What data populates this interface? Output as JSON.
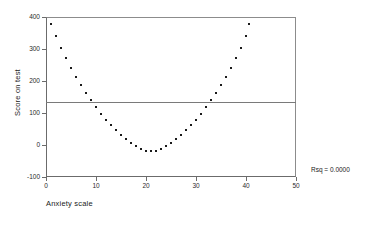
{
  "chart_data": {
    "type": "scatter",
    "title": "",
    "xlabel": "Anxiety scale",
    "ylabel": "Score on test",
    "xlim": [
      0,
      50
    ],
    "ylim": [
      -100,
      400
    ],
    "xticks": [
      0,
      10,
      20,
      30,
      40,
      50
    ],
    "yticks": [
      -100,
      0,
      100,
      200,
      300,
      400
    ],
    "xtick_labels": [
      "0",
      "10",
      "20",
      "30",
      "40",
      "50"
    ],
    "ytick_labels": [
      "-100",
      "0",
      "100",
      "200",
      "300",
      "400"
    ],
    "grid": false,
    "legend": null,
    "annotations": [
      {
        "name": "rsq",
        "text": "Rsq = 0.0000"
      }
    ],
    "reference_line": {
      "orientation": "horizontal",
      "y": 133
    },
    "series": [
      {
        "name": "Score on test vs Anxiety scale",
        "marker": "square",
        "color": "#1a1a1a",
        "points": [
          [
            1,
            378
          ],
          [
            2,
            340
          ],
          [
            3,
            303
          ],
          [
            4,
            272
          ],
          [
            5,
            240
          ],
          [
            6,
            212
          ],
          [
            7,
            187
          ],
          [
            8,
            162
          ],
          [
            9,
            140
          ],
          [
            10,
            118
          ],
          [
            11,
            97
          ],
          [
            12,
            78
          ],
          [
            13,
            62
          ],
          [
            14,
            46
          ],
          [
            15,
            30
          ],
          [
            16,
            18
          ],
          [
            17,
            6
          ],
          [
            18,
            -4
          ],
          [
            19,
            -12
          ],
          [
            20,
            -18
          ],
          [
            21,
            -20
          ],
          [
            22,
            -18
          ],
          [
            23,
            -12
          ],
          [
            24,
            -4
          ],
          [
            25,
            6
          ],
          [
            26,
            18
          ],
          [
            27,
            30
          ],
          [
            28,
            46
          ],
          [
            29,
            62
          ],
          [
            30,
            78
          ],
          [
            31,
            97
          ],
          [
            32,
            118
          ],
          [
            33,
            140
          ],
          [
            34,
            162
          ],
          [
            35,
            187
          ],
          [
            36,
            212
          ],
          [
            37,
            240
          ],
          [
            38,
            272
          ],
          [
            39,
            303
          ],
          [
            40,
            340
          ],
          [
            40.5,
            378
          ]
        ]
      }
    ]
  },
  "stats": {
    "rsq_label": "Rsq = 0.0000"
  }
}
